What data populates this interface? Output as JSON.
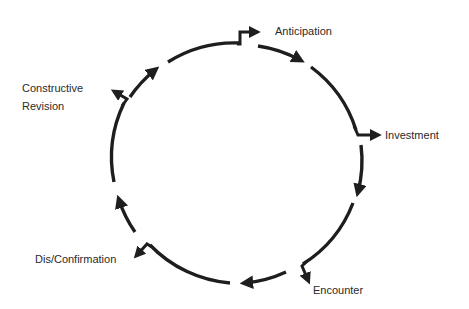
{
  "diagram": {
    "type": "cycle",
    "stages": [
      {
        "label": "Anticipation"
      },
      {
        "label": "Investment"
      },
      {
        "label": "Encounter"
      },
      {
        "label": "Dis/Confirmation"
      },
      {
        "label": "Constructive Revision",
        "lines": [
          "Constructive",
          "Revision"
        ]
      }
    ],
    "direction": "clockwise",
    "stroke_color": "#1e1e1e",
    "text_color": "#2a2a2a"
  }
}
